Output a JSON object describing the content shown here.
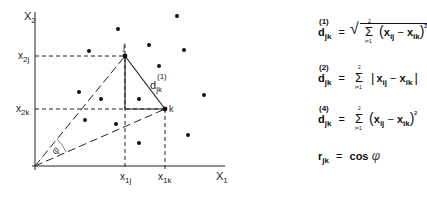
{
  "axes": {
    "y_label": "X",
    "y_label_sub": "2",
    "x_label": "X",
    "x_label_sub": "1"
  },
  "ticks": {
    "x2j": {
      "base": "x",
      "sub": "2j"
    },
    "x2k": {
      "base": "x",
      "sub": "2k"
    },
    "x1j": {
      "base": "x",
      "sub": "1j"
    },
    "x1k": {
      "base": "x",
      "sub": "1k"
    }
  },
  "points": {
    "j": "j",
    "k": "k"
  },
  "labels": {
    "edge_d": "d",
    "edge_d_sup": "(1)",
    "edge_d_sub": "jk",
    "angle": "φ"
  },
  "scatter_points": [
    [
      118,
      29
    ],
    [
      177,
      16
    ],
    [
      89,
      51
    ],
    [
      149,
      45
    ],
    [
      184,
      50
    ],
    [
      159,
      66
    ],
    [
      79,
      92
    ],
    [
      101,
      99
    ],
    [
      139,
      99
    ],
    [
      204,
      95
    ],
    [
      85,
      120
    ],
    [
      116,
      124
    ],
    [
      139,
      143
    ],
    [
      188,
      135
    ]
  ],
  "formulas": {
    "euclidean": {
      "lhs": "d",
      "sup": "(1)",
      "sub": "jk",
      "eq": "=",
      "sum_top": "2",
      "sum_bot": "i=1",
      "term_a": "x",
      "term_a_sub": "ij",
      "minus": "−",
      "term_b": "x",
      "term_b_sub": "ik",
      "power": "2"
    },
    "manhattan": {
      "lhs": "d",
      "sup": "(2)",
      "sub": "jk",
      "eq": "=",
      "sum_top": "2",
      "sum_bot": "i=1",
      "term_a": "x",
      "term_a_sub": "ij",
      "minus": "−",
      "term_b": "x",
      "term_b_sub": "ik"
    },
    "squared": {
      "lhs": "d",
      "sup": "(4)",
      "sub": "jk",
      "eq": "=",
      "sum_top": "2",
      "sum_bot": "i=1",
      "term_a": "x",
      "term_a_sub": "ij",
      "minus": "−",
      "term_b": "x",
      "term_b_sub": "ik",
      "power": "2"
    },
    "correlation": {
      "lhs": "r",
      "sub": "jk",
      "eq": "=",
      "rhs": "cos",
      "angle": "φ"
    }
  }
}
